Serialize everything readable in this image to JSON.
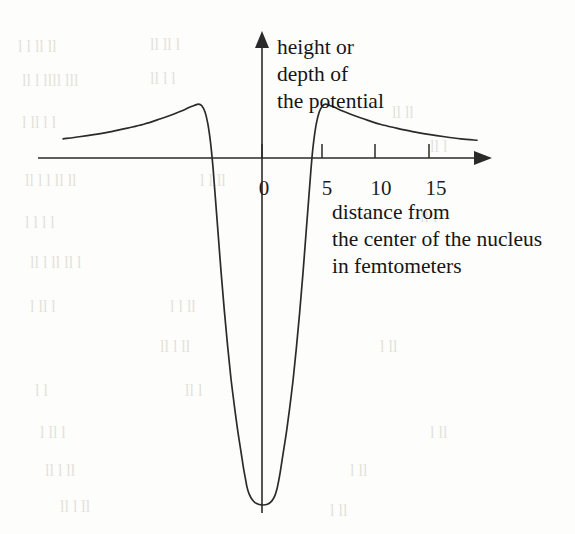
{
  "figure": {
    "kind": "nuclear-potential-diagram",
    "background_color": "#fdfdfb",
    "ink_color": "#2b2b2b"
  },
  "axes": {
    "y_axis": {
      "label_lines": [
        "height or",
        "depth of",
        "the potential"
      ],
      "arrow": "up",
      "zero_position_px": 262
    },
    "x_axis": {
      "label_lines": [
        "distance from",
        "the center of the nucleus",
        "in femtometers"
      ],
      "arrow": "right",
      "unit": "femtometers",
      "tick_values": [
        0,
        5,
        10,
        15
      ],
      "tick_labels": [
        "0",
        "5",
        "10",
        "15"
      ],
      "baseline_y_px": 158
    }
  },
  "chart_data": {
    "type": "line",
    "title": "",
    "subtitle": "",
    "xlabel": "distance from the center of the nucleus in femtometers",
    "ylabel": "height or depth of the potential",
    "xlim": [
      -18.5,
      20
    ],
    "ylim": [
      -1.0,
      0.22
    ],
    "grid": false,
    "legend": null,
    "annotations": [],
    "features": {
      "well_bottom_value": -1.0,
      "well_half_width_fm": 4.9,
      "barrier_peak_value": 0.155,
      "barrier_peak_positions_fm": [
        -5.9,
        5.9
      ],
      "zero_crossings_fm": [
        -4.6,
        4.8
      ],
      "tail_value_at_edge": 0.055
    },
    "series": [
      {
        "name": "potential",
        "x": [
          -18.5,
          -17,
          -15.5,
          -14,
          -12.5,
          -11,
          -9.5,
          -8.5,
          -7.5,
          -6.8,
          -6.3,
          -5.9,
          -5.6,
          -5.3,
          -5.05,
          -4.85,
          -4.7,
          -4.55,
          -4.35,
          -4.1,
          -3.8,
          -3.5,
          -3.2,
          -2.9,
          -2.6,
          -2.3,
          -2.05,
          -1.85,
          -1.7,
          -1.55,
          -1.4,
          -1.2,
          -0.9,
          -0.5,
          0,
          0.5,
          0.9,
          1.2,
          1.4,
          1.55,
          1.7,
          1.85,
          2.05,
          2.3,
          2.6,
          2.9,
          3.2,
          3.5,
          3.8,
          4.1,
          4.35,
          4.55,
          4.7,
          4.85,
          5.05,
          5.3,
          5.6,
          5.9,
          6.3,
          6.8,
          7.5,
          8.5,
          9.5,
          11,
          12.5,
          14,
          15.5,
          17,
          18.5,
          20
        ],
        "y": [
          0.055,
          0.061,
          0.068,
          0.076,
          0.086,
          0.097,
          0.112,
          0.123,
          0.135,
          0.145,
          0.151,
          0.155,
          0.15,
          0.132,
          0.1,
          0.06,
          0.02,
          -0.03,
          -0.11,
          -0.21,
          -0.33,
          -0.44,
          -0.54,
          -0.63,
          -0.705,
          -0.775,
          -0.825,
          -0.865,
          -0.895,
          -0.92,
          -0.945,
          -0.965,
          -0.982,
          -0.993,
          -0.997,
          -0.995,
          -0.986,
          -0.97,
          -0.95,
          -0.928,
          -0.902,
          -0.872,
          -0.832,
          -0.782,
          -0.712,
          -0.635,
          -0.545,
          -0.445,
          -0.335,
          -0.215,
          -0.115,
          -0.035,
          0.018,
          0.058,
          0.098,
          0.13,
          0.149,
          0.155,
          0.151,
          0.145,
          0.135,
          0.123,
          0.112,
          0.097,
          0.086,
          0.076,
          0.068,
          0.061,
          0.055,
          0.051
        ]
      }
    ]
  },
  "scan_artifacts": {
    "visible": true,
    "note": "faint mirrored bleed-through text from the reverse page"
  }
}
